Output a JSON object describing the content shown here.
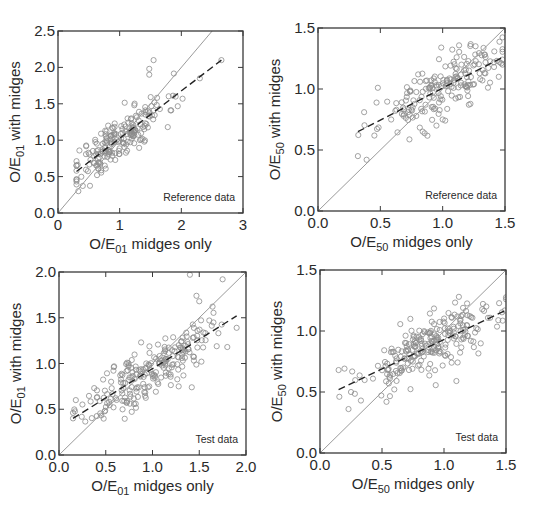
{
  "chart_data": [
    {
      "id": "panel-oe01-reference",
      "type": "scatter",
      "annotation": "Reference data",
      "xlabel": {
        "prefix": "O/E",
        "sub": "01",
        "suffix": " midges only"
      },
      "ylabel": {
        "prefix": "O/E",
        "sub": "01",
        "suffix": " with midges"
      },
      "xlim": [
        0,
        3
      ],
      "ylim": [
        0,
        2.5
      ],
      "xticks": [
        0,
        1,
        2,
        3
      ],
      "xtick_labels": [
        "0",
        "1",
        "2",
        "3"
      ],
      "yticks": [
        0,
        0.5,
        1.0,
        1.5,
        2.0,
        2.5
      ],
      "ytick_labels": [
        "0.0",
        "0.5",
        "1.0",
        "1.5",
        "2.0",
        "2.5"
      ],
      "grid": false,
      "frame": {
        "left": 58,
        "top": 31,
        "right": 243,
        "bottom": 213
      },
      "reference_line": {
        "style": "solid",
        "color": "#9a9a9a",
        "slope": 1,
        "intercept": 0
      },
      "regression_line": {
        "style": "dashed",
        "color": "#222222",
        "x": [
          0.3,
          2.65
        ],
        "y": [
          0.57,
          2.1
        ]
      },
      "n_points": 200,
      "point_spread": {
        "x_center": 1.0,
        "x_sd": 0.38,
        "x_min": 0.3,
        "x_max": 2.65,
        "residual_sd": 0.16,
        "seed": 11
      },
      "extra_points": [
        [
          1.55,
          2.1
        ],
        [
          1.48,
          1.98
        ],
        [
          1.48,
          1.9
        ],
        [
          2.02,
          1.57
        ],
        [
          1.78,
          1.18
        ],
        [
          0.33,
          0.3
        ],
        [
          1.4,
          0.98
        ],
        [
          2.3,
          1.85
        ],
        [
          2.65,
          2.1
        ],
        [
          0.3,
          0.65
        ]
      ]
    },
    {
      "id": "panel-oe50-reference",
      "type": "scatter",
      "annotation": "Reference data",
      "xlabel": {
        "prefix": "O/E",
        "sub": "50",
        "suffix": " midges only"
      },
      "ylabel": {
        "prefix": "O/E",
        "sub": "50",
        "suffix": " with midges"
      },
      "xlim": [
        0,
        1.5
      ],
      "ylim": [
        0,
        1.5
      ],
      "xticks": [
        0,
        0.5,
        1.0,
        1.5
      ],
      "xtick_labels": [
        "0.0",
        "0.5",
        "1.0",
        "1.5"
      ],
      "yticks": [
        0,
        0.5,
        1.0,
        1.5
      ],
      "ytick_labels": [
        "0.0",
        "0.5",
        "1.0",
        "1.5"
      ],
      "grid": false,
      "frame": {
        "left": 318,
        "top": 28,
        "right": 505,
        "bottom": 211
      },
      "reference_line": {
        "style": "solid",
        "color": "#9a9a9a",
        "slope": 1,
        "intercept": 0
      },
      "regression_line": {
        "style": "dashed",
        "color": "#222222",
        "x": [
          0.32,
          1.5
        ],
        "y": [
          0.65,
          1.27
        ]
      },
      "n_points": 190,
      "point_spread": {
        "x_center": 1.0,
        "x_sd": 0.25,
        "x_min": 0.32,
        "x_max": 1.48,
        "residual_sd": 0.11,
        "seed": 23
      },
      "extra_points": [
        [
          0.32,
          0.45
        ],
        [
          0.39,
          0.42
        ],
        [
          0.48,
          1.01
        ],
        [
          0.95,
          0.7
        ],
        [
          1.0,
          0.75
        ],
        [
          0.37,
          0.81
        ],
        [
          1.45,
          1.1
        ],
        [
          1.47,
          1.21
        ]
      ]
    },
    {
      "id": "panel-oe01-test",
      "type": "scatter",
      "annotation": "Test data",
      "xlabel": {
        "prefix": "O/E",
        "sub": "01",
        "suffix": " midges only"
      },
      "ylabel": {
        "prefix": "O/E",
        "sub": "01",
        "suffix": " with midges"
      },
      "xlim": [
        0,
        2.0
      ],
      "ylim": [
        0,
        2.0
      ],
      "xticks": [
        0,
        0.5,
        1.0,
        1.5,
        2.0
      ],
      "xtick_labels": [
        "0.0",
        "0.5",
        "1.0",
        "1.5",
        "2.0"
      ],
      "yticks": [
        0,
        0.5,
        1.0,
        1.5,
        2.0
      ],
      "ytick_labels": [
        "0.0",
        "0.5",
        "1.0",
        "1.5",
        "2.0"
      ],
      "grid": false,
      "frame": {
        "left": 59,
        "top": 272,
        "right": 246,
        "bottom": 455
      },
      "reference_line": {
        "style": "solid",
        "color": "#9a9a9a",
        "slope": 1,
        "intercept": 0
      },
      "regression_line": {
        "style": "dashed",
        "color": "#222222",
        "x": [
          0.15,
          1.9
        ],
        "y": [
          0.4,
          1.52
        ]
      },
      "n_points": 230,
      "point_spread": {
        "x_center": 0.95,
        "x_sd": 0.33,
        "x_min": 0.15,
        "x_max": 1.9,
        "residual_sd": 0.15,
        "seed": 37
      },
      "extra_points": [
        [
          1.4,
          1.97
        ],
        [
          1.75,
          1.92
        ],
        [
          1.47,
          1.74
        ],
        [
          1.5,
          1.68
        ],
        [
          0.18,
          0.6
        ],
        [
          0.15,
          0.4
        ],
        [
          1.9,
          1.39
        ],
        [
          1.8,
          1.18
        ],
        [
          1.42,
          0.74
        ],
        [
          1.28,
          0.75
        ]
      ]
    },
    {
      "id": "panel-oe50-test",
      "type": "scatter",
      "annotation": "Test data",
      "xlabel": {
        "prefix": "O/E",
        "sub": "50",
        "suffix": " midges only"
      },
      "ylabel": {
        "prefix": "O/E",
        "sub": "50",
        "suffix": " with midges"
      },
      "xlim": [
        0,
        1.5
      ],
      "ylim": [
        0,
        1.5
      ],
      "xticks": [
        0,
        0.5,
        1.0,
        1.5
      ],
      "xtick_labels": [
        "0.0",
        "0.5",
        "1.0",
        "1.5"
      ],
      "yticks": [
        0,
        0.5,
        1.0,
        1.5
      ],
      "ytick_labels": [
        "0.0",
        "0.5",
        "1.0",
        "1.5"
      ],
      "grid": false,
      "frame": {
        "left": 320,
        "top": 270,
        "right": 506,
        "bottom": 453
      },
      "reference_line": {
        "style": "solid",
        "color": "#9a9a9a",
        "slope": 1,
        "intercept": 0
      },
      "regression_line": {
        "style": "dashed",
        "color": "#222222",
        "x": [
          0.15,
          1.5
        ],
        "y": [
          0.52,
          1.17
        ]
      },
      "n_points": 240,
      "point_spread": {
        "x_center": 0.9,
        "x_sd": 0.28,
        "x_min": 0.15,
        "x_max": 1.5,
        "residual_sd": 0.12,
        "seed": 53
      },
      "extra_points": [
        [
          0.15,
          0.68
        ],
        [
          0.23,
          0.36
        ],
        [
          0.33,
          0.43
        ],
        [
          1.1,
          0.59
        ],
        [
          1.5,
          1.26
        ],
        [
          1.12,
          1.28
        ],
        [
          0.25,
          0.5
        ]
      ]
    }
  ],
  "style": {
    "marker_color": "#8c8c8c",
    "frame_color": "#3a3a3a",
    "reference_line_color": "#9a9a9a",
    "regression_line_color": "#222222"
  }
}
